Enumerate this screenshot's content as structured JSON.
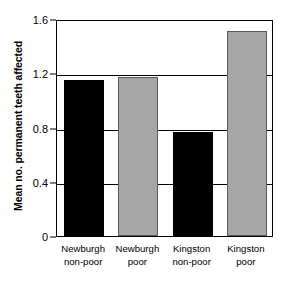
{
  "chart_data": {
    "type": "bar",
    "title": "",
    "xlabel": "",
    "ylabel": "Mean no. permanent teeth affected",
    "ylim": [
      0,
      1.6
    ],
    "ytick_values": [
      0,
      0.4,
      0.8,
      1.2,
      1.6
    ],
    "ytick_labels": [
      "0",
      "0.4",
      "0.8",
      "1.2",
      "1.6"
    ],
    "grid": true,
    "legend": "none",
    "categories": [
      "Newburgh non-poor",
      "Newburgh poor",
      "Kingston non-poor",
      "Kingston poor"
    ],
    "category_lines": [
      [
        "Newburgh",
        "non-poor"
      ],
      [
        "Newburgh",
        "poor"
      ],
      [
        "Kingston",
        "non-poor"
      ],
      [
        "Kingston",
        "poor"
      ]
    ],
    "values": [
      1.15,
      1.17,
      0.77,
      1.51
    ],
    "bar_colors": [
      "#000000",
      "#a6a6a6",
      "#000000",
      "#a6a6a6"
    ],
    "bar_color_names": [
      "black",
      "gray",
      "black",
      "gray"
    ]
  },
  "colors": {
    "black_bar": "#000000",
    "gray_bar": "#a6a6a6",
    "gray_bar_border": "#5a5a5a",
    "axis": "#000000",
    "background": "#ffffff"
  }
}
